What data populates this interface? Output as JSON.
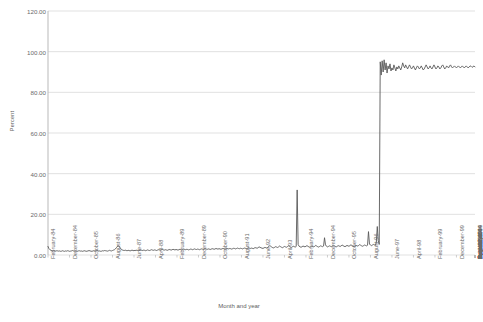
{
  "chart_data": {
    "type": "line",
    "title": "",
    "xlabel": "Month and year",
    "ylabel": "Percent",
    "ylim": [
      0,
      120
    ],
    "yticks": [
      "0.00",
      "20.00",
      "40.00",
      "60.00",
      "80.00",
      "100.00",
      "120.00"
    ],
    "ytick_values": [
      0,
      20,
      40,
      60,
      80,
      100,
      120
    ],
    "grid": "horizontal",
    "legend": "none",
    "xtick_labels": [
      "February-84",
      "December-84",
      "October-85",
      "August-86",
      "June-87",
      "April-88",
      "February-89",
      "December-89",
      "October-90",
      "August-91",
      "June-92",
      "April-93",
      "February-94",
      "December-94",
      "October-95",
      "August-96",
      "June-97",
      "April-98",
      "February-99",
      "December-99",
      "October-00",
      "August-01",
      "June-02",
      "April-03",
      "February-04",
      "December-04",
      "October-05",
      "August-06",
      "June-07",
      "April-08",
      "February-09",
      "December-09",
      "October-10",
      "August-11",
      "June-12",
      "April-13",
      "February-14",
      "December-14",
      "October-15"
    ],
    "xtick_interval_months": 22,
    "x_start": "February-84",
    "x_end": "October-15",
    "series": [
      {
        "name": "Percent",
        "color": "#595959",
        "values": [
          4.2,
          3.1,
          2.6,
          2.3,
          2.1,
          2.0,
          2.2,
          2.0,
          1.9,
          2.1,
          2.0,
          1.9,
          2.0,
          1.8,
          1.9,
          2.1,
          1.9,
          1.8,
          2.0,
          1.9,
          2.1,
          2.0,
          1.8,
          1.9,
          2.0,
          2.2,
          2.0,
          1.9,
          2.1,
          1.9,
          1.8,
          2.0,
          2.1,
          1.9,
          2.0,
          1.8,
          1.9,
          2.1,
          2.0,
          1.8,
          1.9,
          2.0,
          2.2,
          2.0,
          1.9,
          1.8,
          2.0,
          2.1,
          1.9,
          2.0,
          2.2,
          2.1,
          1.9,
          2.0,
          1.8,
          1.9,
          2.1,
          2.0,
          2.2,
          2.1,
          2.0,
          1.9,
          2.1,
          2.3,
          2.1,
          2.0,
          2.2,
          2.4,
          2.6,
          3.0,
          3.6,
          4.2,
          4.6,
          4.1,
          3.4,
          2.8,
          2.5,
          2.3,
          2.2,
          2.4,
          2.2,
          2.1,
          2.3,
          2.2,
          2.0,
          2.2,
          2.4,
          2.2,
          2.1,
          2.3,
          2.2,
          2.4,
          2.2,
          2.1,
          2.3,
          2.5,
          2.3,
          2.2,
          2.4,
          2.3,
          2.1,
          2.3,
          2.5,
          2.3,
          2.2,
          2.4,
          2.6,
          2.4,
          2.3,
          2.5,
          2.4,
          2.2,
          2.4,
          2.6,
          2.5,
          2.3,
          2.5,
          2.7,
          2.5,
          2.4,
          2.6,
          2.5,
          2.3,
          2.5,
          2.7,
          2.6,
          2.4,
          2.6,
          2.8,
          2.6,
          2.5,
          2.7,
          2.6,
          2.4,
          2.6,
          2.8,
          2.7,
          2.5,
          2.7,
          2.9,
          2.7,
          2.6,
          2.8,
          2.7,
          2.5,
          2.7,
          2.9,
          2.8,
          2.6,
          2.8,
          3.0,
          2.8,
          2.7,
          2.9,
          2.8,
          2.6,
          2.8,
          3.0,
          2.9,
          2.7,
          2.9,
          3.1,
          2.9,
          2.8,
          3.0,
          2.9,
          2.7,
          2.9,
          3.1,
          3.0,
          2.8,
          3.0,
          3.2,
          3.0,
          2.9,
          3.1,
          3.0,
          2.8,
          3.0,
          3.2,
          3.1,
          2.9,
          3.1,
          3.3,
          3.1,
          3.0,
          3.2,
          3.1,
          2.9,
          3.1,
          3.3,
          3.2,
          3.0,
          3.2,
          3.4,
          3.2,
          3.1,
          3.3,
          3.2,
          3.0,
          3.2,
          3.4,
          3.3,
          3.1,
          3.3,
          3.6,
          3.4,
          3.2,
          3.4,
          3.3,
          3.1,
          3.4,
          3.6,
          3.5,
          3.3,
          3.6,
          4.0,
          3.8,
          3.5,
          3.4,
          3.2,
          3.5,
          3.7,
          3.6,
          3.4,
          3.8,
          4.2,
          4.6,
          4.3,
          3.9,
          3.6,
          3.5,
          3.8,
          4.1,
          3.9,
          3.7,
          4.0,
          4.4,
          4.1,
          3.8,
          3.6,
          3.9,
          4.2,
          4.0,
          3.8,
          4.1,
          4.5,
          4.2,
          3.9,
          3.7,
          4.0,
          4.3,
          4.1,
          3.9,
          4.2,
          32.0,
          5.2,
          4.3,
          4.0,
          3.8,
          4.1,
          4.4,
          4.2,
          4.0,
          4.3,
          4.6,
          4.3,
          4.0,
          3.8,
          4.1,
          4.4,
          4.2,
          4.0,
          4.3,
          4.7,
          4.4,
          4.1,
          3.9,
          4.2,
          4.5,
          4.3,
          4.1,
          4.4,
          8.5,
          5.0,
          4.3,
          4.0,
          4.2,
          4.5,
          4.3,
          4.1,
          4.4,
          4.8,
          4.5,
          4.2,
          4.0,
          4.3,
          4.6,
          4.4,
          4.2,
          4.5,
          4.9,
          4.6,
          4.3,
          4.1,
          4.4,
          4.7,
          4.5,
          4.3,
          4.6,
          5.0,
          4.7,
          4.4,
          4.2,
          4.5,
          4.8,
          4.6,
          4.4,
          4.7,
          5.1,
          4.8,
          4.5,
          4.3,
          4.6,
          4.9,
          4.7,
          4.5,
          4.8,
          11.5,
          5.4,
          4.9,
          4.6,
          4.9,
          5.2,
          5.0,
          4.8,
          6.0,
          14.0,
          7.0,
          5.2,
          95.0,
          88.5,
          95.5,
          90.0,
          96.0,
          91.0,
          94.5,
          89.5,
          93.0,
          91.5,
          94.0,
          90.5,
          92.0,
          91.0,
          93.5,
          92.0,
          90.5,
          92.5,
          91.5,
          93.0,
          92.0,
          91.0,
          92.5,
          94.5,
          93.0,
          92.0,
          93.5,
          92.5,
          91.5,
          92.5,
          93.5,
          92.5,
          91.5,
          92.0,
          93.0,
          92.0,
          91.0,
          92.0,
          93.0,
          92.5,
          91.5,
          92.0,
          93.0,
          92.0,
          91.0,
          91.5,
          92.5,
          93.5,
          92.5,
          91.5,
          92.0,
          93.0,
          92.0,
          91.5,
          92.5,
          93.5,
          92.5,
          91.5,
          92.0,
          93.0,
          92.5,
          91.5,
          92.0,
          93.0,
          93.5,
          92.5,
          91.5,
          92.0,
          93.0,
          92.5,
          92.0,
          93.0,
          93.5,
          92.5,
          92.0,
          92.5,
          93.0,
          92.5,
          92.0,
          92.5,
          93.0,
          92.5,
          92.0,
          92.5,
          93.0,
          92.5,
          92.0,
          92.5,
          93.0,
          92.5,
          92.0,
          92.5,
          93.0,
          92.8,
          92.3,
          92.6,
          93.0,
          92.5
        ]
      }
    ]
  }
}
